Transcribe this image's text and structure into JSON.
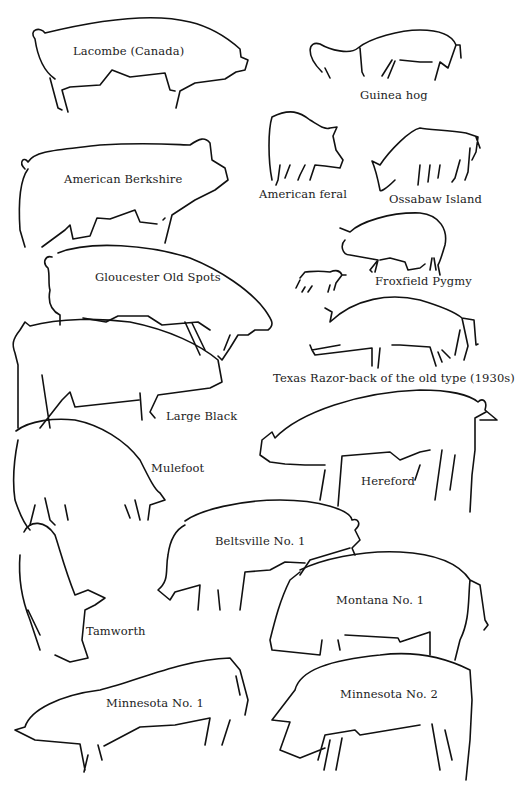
{
  "figure": {
    "type": "illustration",
    "colors": {
      "stroke": "#111111",
      "text": "#222222",
      "background": "#ffffff"
    }
  },
  "breeds": [
    {
      "id": "lacombe",
      "label": "Lacombe (Canada)",
      "x": 73,
      "y": 44
    },
    {
      "id": "guinea-hog",
      "label": "Guinea hog",
      "x": 360,
      "y": 88
    },
    {
      "id": "american-berkshire",
      "label": "American Berkshire",
      "x": 64,
      "y": 172
    },
    {
      "id": "american-feral",
      "label": "American feral",
      "x": 259,
      "y": 187
    },
    {
      "id": "ossabaw-island",
      "label": "Ossabaw Island",
      "x": 389,
      "y": 192
    },
    {
      "id": "gloucester-old-spots",
      "label": "Gloucester Old Spots",
      "x": 95,
      "y": 270
    },
    {
      "id": "froxfield-pygmy",
      "label": "Froxfield Pygmy",
      "x": 375,
      "y": 274
    },
    {
      "id": "texas-razor-back",
      "label": "Texas Razor-back of the old type (1930s)",
      "x": 273,
      "y": 371
    },
    {
      "id": "large-black",
      "label": "Large Black",
      "x": 166,
      "y": 409
    },
    {
      "id": "mulefoot",
      "label": "Mulefoot",
      "x": 151,
      "y": 461
    },
    {
      "id": "hereford",
      "label": "Hereford",
      "x": 361,
      "y": 474
    },
    {
      "id": "beltsville-no-1",
      "label": "Beltsville No. 1",
      "x": 215,
      "y": 534
    },
    {
      "id": "montana-no-1",
      "label": "Montana No. 1",
      "x": 336,
      "y": 593
    },
    {
      "id": "tamworth",
      "label": "Tamworth",
      "x": 86,
      "y": 624
    },
    {
      "id": "minnesota-no-1",
      "label": "Minnesota No. 1",
      "x": 106,
      "y": 696
    },
    {
      "id": "minnesota-no-2",
      "label": "Minnesota No. 2",
      "x": 340,
      "y": 687
    }
  ]
}
